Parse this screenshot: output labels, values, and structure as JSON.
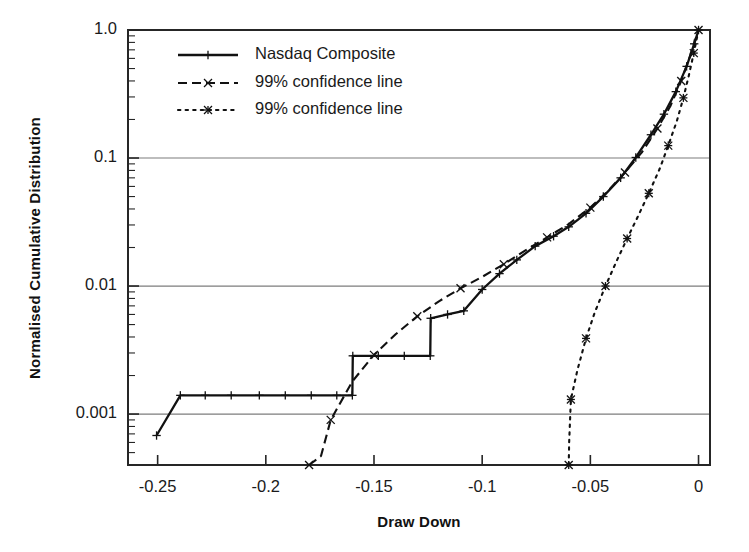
{
  "chart_data": {
    "type": "line",
    "title": "",
    "xlabel": "Draw Down",
    "ylabel": "Normalised Cumulative Distribution",
    "yscale": "log",
    "xscale": "linear",
    "xlim": [
      -0.2637,
      0.0053
    ],
    "ylim": [
      0.0004,
      1.0
    ],
    "grid": "horizontal-major",
    "legend_position": "top-left-inside",
    "xticks": [
      -0.25,
      -0.2,
      -0.15,
      -0.1,
      -0.05,
      0
    ],
    "xtick_labels": [
      "-0.25",
      "-0.2",
      "-0.15",
      "-0.1",
      "-0.05",
      "0"
    ],
    "yticks": [
      1.0,
      0.1,
      0.01,
      0.001
    ],
    "ytick_labels": [
      "1.0",
      "0.1",
      "0.01",
      "0.001"
    ],
    "series": [
      {
        "name": "Nasdaq Composite",
        "style": "solid",
        "marker": "plus",
        "color": "#111111",
        "points": [
          [
            -0.2505,
            0.00068
          ],
          [
            -0.2395,
            0.0014
          ],
          [
            -0.228,
            0.0014
          ],
          [
            -0.216,
            0.0014
          ],
          [
            -0.203,
            0.0014
          ],
          [
            -0.191,
            0.0014
          ],
          [
            -0.179,
            0.0014
          ],
          [
            -0.1672,
            0.0014
          ],
          [
            -0.16,
            0.0014
          ],
          [
            -0.1598,
            0.00285
          ],
          [
            -0.148,
            0.00285
          ],
          [
            -0.136,
            0.00285
          ],
          [
            -0.124,
            0.00285
          ],
          [
            -0.1238,
            0.0056
          ],
          [
            -0.116,
            0.006
          ],
          [
            -0.1085,
            0.0064
          ],
          [
            -0.1,
            0.0094
          ],
          [
            -0.092,
            0.0125
          ],
          [
            -0.084,
            0.016
          ],
          [
            -0.0755,
            0.0205
          ],
          [
            -0.067,
            0.0245
          ],
          [
            -0.06,
            0.029
          ],
          [
            -0.052,
            0.037
          ],
          [
            -0.044,
            0.05
          ],
          [
            -0.036,
            0.07
          ],
          [
            -0.029,
            0.101
          ],
          [
            -0.022,
            0.152
          ],
          [
            -0.016,
            0.22
          ],
          [
            -0.0105,
            0.33
          ],
          [
            -0.0055,
            0.52
          ],
          [
            -0.002,
            0.78
          ],
          [
            0.0,
            1.0
          ]
        ]
      },
      {
        "name": "99% confidence line",
        "style": "dashed",
        "marker": "x",
        "color": "#111111",
        "points": [
          [
            -0.18,
            0.0004
          ],
          [
            -0.1745,
            0.00047
          ],
          [
            -0.17,
            0.0009
          ],
          [
            -0.16,
            0.0018
          ],
          [
            -0.15,
            0.0029
          ],
          [
            -0.14,
            0.0042
          ],
          [
            -0.13,
            0.0058
          ],
          [
            -0.12,
            0.0076
          ],
          [
            -0.11,
            0.0096
          ],
          [
            -0.1,
            0.0118
          ],
          [
            -0.09,
            0.0148
          ],
          [
            -0.08,
            0.019
          ],
          [
            -0.07,
            0.024
          ],
          [
            -0.06,
            0.0305
          ],
          [
            -0.05,
            0.041
          ],
          [
            -0.042,
            0.055
          ],
          [
            -0.034,
            0.077
          ],
          [
            -0.026,
            0.112
          ],
          [
            -0.019,
            0.17
          ],
          [
            -0.013,
            0.255
          ],
          [
            -0.008,
            0.4
          ],
          [
            -0.004,
            0.62
          ],
          [
            0.0,
            1.0
          ]
        ]
      },
      {
        "name": "99% confidence line",
        "style": "dotted",
        "marker": "star",
        "color": "#111111",
        "points": [
          [
            -0.06,
            0.0004
          ],
          [
            -0.0598,
            0.0006
          ],
          [
            -0.059,
            0.0013
          ],
          [
            -0.056,
            0.0022
          ],
          [
            -0.052,
            0.0039
          ],
          [
            -0.048,
            0.0062
          ],
          [
            -0.043,
            0.01
          ],
          [
            -0.038,
            0.0155
          ],
          [
            -0.033,
            0.0235
          ],
          [
            -0.028,
            0.035
          ],
          [
            -0.023,
            0.053
          ],
          [
            -0.018,
            0.082
          ],
          [
            -0.014,
            0.125
          ],
          [
            -0.01,
            0.195
          ],
          [
            -0.007,
            0.295
          ],
          [
            -0.0045,
            0.44
          ],
          [
            -0.0022,
            0.66
          ],
          [
            0.0,
            1.0
          ]
        ]
      }
    ]
  },
  "legend": {
    "entries": [
      {
        "label": "Nasdaq Composite"
      },
      {
        "label": "99% confidence line"
      },
      {
        "label": "99% confidence line"
      }
    ]
  },
  "axes": {
    "x_title": "Draw Down",
    "y_title": "Normalised Cumulative Distribution"
  }
}
